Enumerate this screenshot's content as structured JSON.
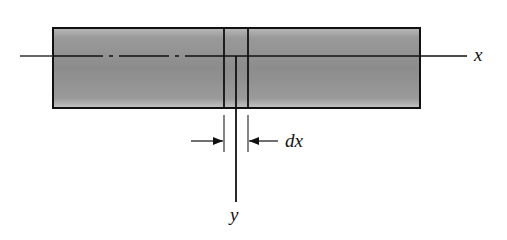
{
  "diagram": {
    "type": "beam-element",
    "labels": {
      "x_axis": "x",
      "y_axis": "y",
      "element_width": "dx"
    },
    "colors": {
      "beam_fill_dark": "#8a8a8a",
      "beam_fill_light": "#bdbdbd",
      "stroke": "#111111"
    }
  }
}
